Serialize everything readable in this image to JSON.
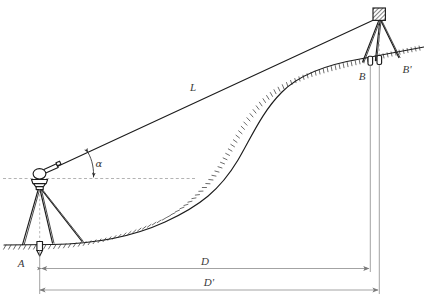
{
  "figure": {
    "background_color": "#ffffff",
    "line_color": "#1c1c1c",
    "dimension_color": "#7b7b7b",
    "dashed_color": "#9a9a9a"
  },
  "labels": {
    "slope_distance": "L",
    "vertical_angle": "α",
    "station_a": "A",
    "station_b": "B",
    "station_b_prime": "B'",
    "horizontal_distance": "D",
    "horizontal_distance_prime": "D'"
  },
  "elements": {
    "instrument": "theodolite-on-tripod",
    "target": "hatched-target-on-tripod",
    "ground": "hatched-terrain-profile",
    "sight_line": "line-of-sight-L",
    "horizon_line": "horizontal-reference-dashed",
    "plumb_line": "target-plumb-dashed",
    "marker_a": "ground-marker-stake",
    "marker_b": "ground-marker-stake",
    "marker_b_prime": "ground-marker-stake"
  },
  "dimensions": {
    "d_line": "horizontal-distance-dimension",
    "d_prime_line": "horizontal-distance-prime-dimension"
  }
}
